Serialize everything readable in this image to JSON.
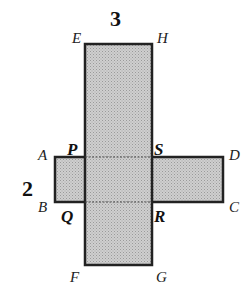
{
  "diagram": {
    "fill_color": "#c8c8c8",
    "stroke_color": "#222222",
    "dimensions": {
      "top_width": "3",
      "left_height": "2"
    },
    "vertices": {
      "E": "E",
      "H": "H",
      "F": "F",
      "G": "G",
      "A": "A",
      "B": "B",
      "C": "C",
      "D": "D",
      "P": "P",
      "Q": "Q",
      "R": "R",
      "S": "S"
    }
  }
}
